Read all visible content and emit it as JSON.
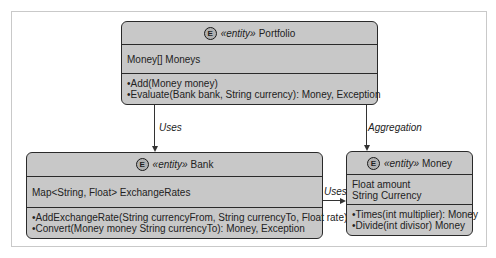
{
  "classes": {
    "portfolio": {
      "badge": "E",
      "stereotype": "«entity»",
      "name": "Portfolio",
      "attributes": [
        "Money[] Moneys"
      ],
      "methods": [
        "•Add(Money money)",
        "•Evaluate(Bank bank, String currency): Money, Exception"
      ]
    },
    "bank": {
      "badge": "E",
      "stereotype": "«entity»",
      "name": "Bank",
      "attributes": [
        "Map<String, Float> ExchangeRates"
      ],
      "methods": [
        "•AddExchangeRate(String currencyFrom, String currencyTo, Float rate)",
        "•Convert(Money money String currencyTo): Money, Exception"
      ]
    },
    "money": {
      "badge": "E",
      "stereotype": "«entity»",
      "name": "Money",
      "attributes": [
        "Float amount",
        "String Currency"
      ],
      "methods": [
        "•Times(int multiplier): Money",
        "•Divide(int divisor) Money"
      ]
    }
  },
  "relations": {
    "portfolio_bank": "Uses",
    "portfolio_money": "Aggregation",
    "bank_money": "Uses"
  }
}
